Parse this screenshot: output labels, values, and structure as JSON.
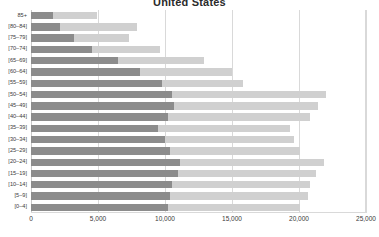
{
  "chart_data": {
    "type": "bar",
    "title": "United States",
    "xlabel": "",
    "ylabel": "",
    "orientation": "horizontal",
    "grid": true,
    "legend": "none",
    "xlim": [
      0,
      25000
    ],
    "xticks": [
      0,
      5000,
      10000,
      15000,
      20000,
      25000
    ],
    "xtick_labels": [
      "0",
      "5,000",
      "10,000",
      "15,000",
      "20,000",
      "25,000"
    ],
    "categories": [
      "85+",
      "[80–84]",
      "[75–79]",
      "[70–74]",
      "[65–69]",
      "[60–64]",
      "[55–59]",
      "[50–54]",
      "[45–49]",
      "[40–44]",
      "[35–39]",
      "[30–34]",
      "[25–29]",
      "[20–24]",
      "[15–19]",
      "[10–14]",
      "[5–9]",
      "[0–4]"
    ],
    "series": [
      {
        "name": "background-series",
        "color": "#d0d0d0",
        "values": [
          4900,
          7900,
          7350,
          9600,
          12900,
          15000,
          15800,
          22050,
          21400,
          20800,
          19300,
          19600,
          20100,
          21850,
          21300,
          20800,
          20700,
          20100
        ]
      },
      {
        "name": "foreground-series",
        "color": "#8c8c8c",
        "values": [
          1650,
          2150,
          3200,
          4550,
          6500,
          8150,
          9800,
          10500,
          10650,
          10250,
          9450,
          10000,
          10400,
          11100,
          10950,
          10500,
          10400,
          10200
        ]
      }
    ]
  },
  "colors": {
    "background_bar": "#d0d0d0",
    "foreground_bar": "#8c8c8c",
    "gridline": "#d9d9d9",
    "text": "#3a3a3a",
    "title": "#2b2b2b",
    "canvas": "#ffffff"
  }
}
